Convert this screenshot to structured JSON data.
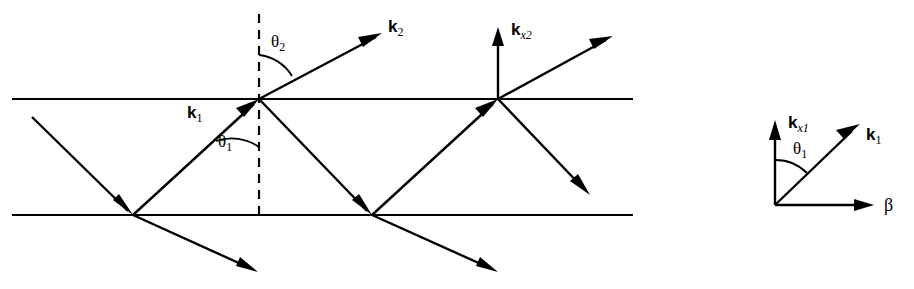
{
  "figure": {
    "background_color": "#ffffff",
    "ink_color": "#000000",
    "width": 914,
    "height": 289
  },
  "main_diagram": {
    "description": "Zig-zag ray bouncing between two parallel horizontal boundaries, with a refracted ray escaping at the top surface",
    "boundaries": [
      {
        "name": "top-boundary",
        "y": 99,
        "x_start": 12,
        "x_end": 633
      },
      {
        "name": "bottom-boundary",
        "y": 215,
        "x_start": 12,
        "x_end": 633
      }
    ],
    "normal_line": {
      "name": "surface-normal",
      "x": 259,
      "y_top": 14,
      "y_bottom": 218,
      "style": "dashed"
    },
    "labels": {
      "k1": {
        "symbol": "k",
        "subscript": "1",
        "subscript_style": "upright"
      },
      "k2": {
        "symbol": "k",
        "subscript": "2",
        "subscript_style": "upright"
      },
      "kx2": {
        "symbol": "k",
        "subscript": "x2",
        "subscript_style": "italic"
      },
      "theta1": {
        "symbol": "θ",
        "subscript": "1"
      },
      "theta2": {
        "symbol": "θ",
        "subscript": "2"
      }
    }
  },
  "inset_diagram": {
    "description": "Vector triangle showing k1 resolved into kx1 (vertical) and beta (horizontal) components separated by angle theta1",
    "origin": {
      "x": 775,
      "y": 205
    },
    "labels": {
      "kx1": {
        "symbol": "k",
        "subscript": "x1",
        "subscript_style": "italic"
      },
      "k1": {
        "symbol": "k",
        "subscript": "1",
        "subscript_style": "upright"
      },
      "theta1": {
        "symbol": "θ",
        "subscript": "1"
      },
      "beta": {
        "symbol": "β",
        "subscript": ""
      }
    }
  }
}
